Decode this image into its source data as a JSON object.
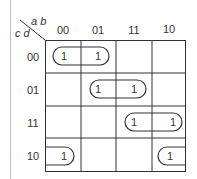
{
  "kmap": {
    "row_var": "c d",
    "col_var": "a b",
    "col_labels": [
      "00",
      "01",
      "11",
      "10"
    ],
    "row_labels": [
      "00",
      "01",
      "11",
      "10"
    ],
    "cells": [
      [
        "1",
        "1",
        "",
        ""
      ],
      [
        "",
        "1",
        "1",
        ""
      ],
      [
        "",
        "",
        "1",
        "1"
      ],
      [
        "1",
        "",
        "",
        "1"
      ]
    ],
    "groups": [
      {
        "row": 0,
        "cols": [
          0,
          1
        ],
        "label": "pair-r00-c00-01"
      },
      {
        "row": 1,
        "cols": [
          1,
          2
        ],
        "label": "pair-r01-c01-11"
      },
      {
        "row": 2,
        "cols": [
          2,
          3
        ],
        "label": "pair-r11-c11-10"
      },
      {
        "row": 3,
        "cols": [
          3,
          0
        ],
        "label": "wrap-pair-r10-c10-00"
      }
    ]
  }
}
